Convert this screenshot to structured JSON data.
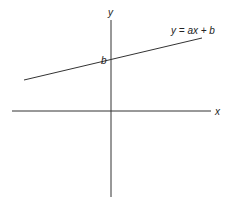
{
  "diagram": {
    "colors": {
      "axis": "#333333",
      "line": "#333333",
      "text": "#222222",
      "background": "#ffffff"
    },
    "axes": {
      "x": {
        "label": "x"
      },
      "y": {
        "label": "y"
      }
    },
    "line": {
      "equation": "y = ax + b",
      "intercept_label": "b"
    }
  }
}
